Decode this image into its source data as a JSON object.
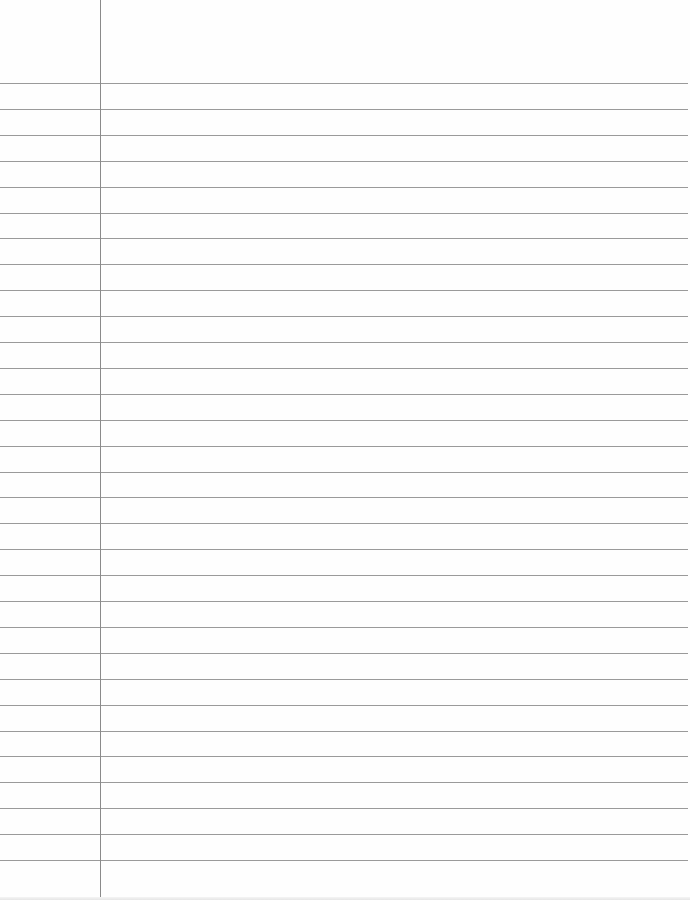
{
  "paper": {
    "type": "lined-notebook-page",
    "background_color": "#fefefe",
    "rule_color": "#9a9a9a",
    "margin_color": "#8a8a8a",
    "margin_x": 100,
    "first_rule_y": 83,
    "rule_spacing": 25.9,
    "rule_count": 31,
    "text_lines": []
  }
}
